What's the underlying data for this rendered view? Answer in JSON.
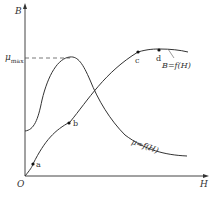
{
  "diagram": {
    "title": "",
    "axes": {
      "y_label": "B",
      "x_label": "H",
      "origin_label": "O",
      "y_marker": {
        "symbol": "μ",
        "subscript": "max"
      }
    },
    "curves": [
      {
        "name": "B-H magnetization curve",
        "label": "B=f(H)"
      },
      {
        "name": "permeability curve",
        "label": "μ=f(H)"
      }
    ],
    "points": [
      {
        "label": "a"
      },
      {
        "label": "b"
      },
      {
        "label": "c"
      },
      {
        "label": "d"
      }
    ],
    "colors": {
      "line": "#333333",
      "background": "#ffffff"
    }
  }
}
